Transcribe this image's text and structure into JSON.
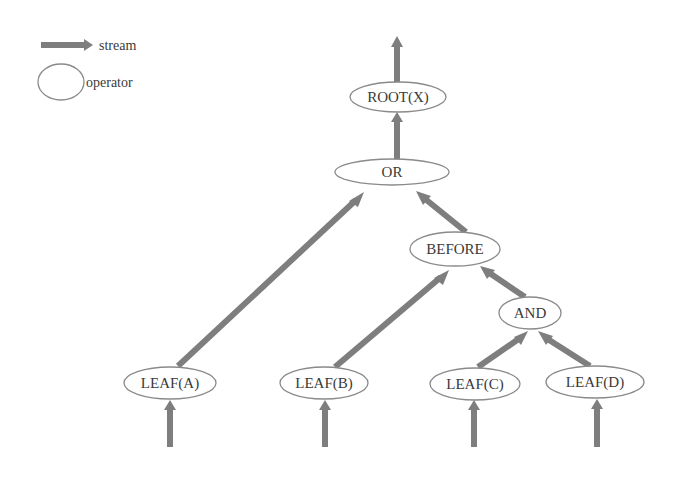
{
  "legend": {
    "stream_label": "stream",
    "operator_label": "operator"
  },
  "nodes": {
    "root": "ROOT(X)",
    "or": "OR",
    "before": "BEFORE",
    "and": "AND",
    "leaf_a": "LEAF(A)",
    "leaf_b": "LEAF(B)",
    "leaf_c": "LEAF(C)",
    "leaf_d": "LEAF(D)"
  },
  "edges": [
    {
      "from": "input",
      "to": "leaf_a"
    },
    {
      "from": "input",
      "to": "leaf_b"
    },
    {
      "from": "input",
      "to": "leaf_c"
    },
    {
      "from": "input",
      "to": "leaf_d"
    },
    {
      "from": "leaf_a",
      "to": "or"
    },
    {
      "from": "leaf_b",
      "to": "before"
    },
    {
      "from": "leaf_c",
      "to": "and"
    },
    {
      "from": "leaf_d",
      "to": "and"
    },
    {
      "from": "and",
      "to": "before"
    },
    {
      "from": "before",
      "to": "or"
    },
    {
      "from": "or",
      "to": "root"
    },
    {
      "from": "root",
      "to": "output"
    }
  ],
  "colors": {
    "stream": "#7e7e7e",
    "node_border": "#8a8a8a",
    "text": "#3a3a3a"
  }
}
